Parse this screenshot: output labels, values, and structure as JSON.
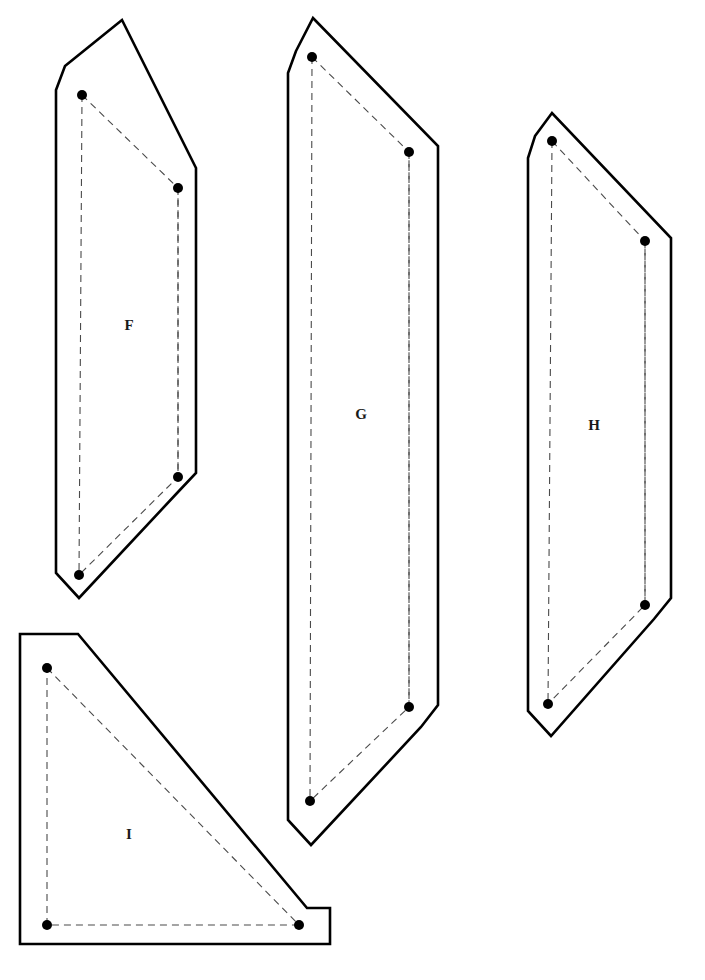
{
  "document": {
    "type": "technical-pattern-sheet",
    "title": "Pattern Pieces F G H I",
    "background_color": "#ffffff",
    "width": 705,
    "height": 980
  },
  "style": {
    "outline_color": "#000000",
    "outline_width": 2.6,
    "seam_color": "#4a4a4a",
    "seam_width": 1.1,
    "seam_dash": "7 5",
    "dot_color": "#000000",
    "dot_radius": 5.0,
    "label_color": "#1a1a1a",
    "label_size": 15
  },
  "pieces": [
    {
      "id": "piece-f",
      "label": "F",
      "label_position": {
        "x": 129,
        "y": 327
      },
      "outline_points": "65,66 122,20 196,168 196,473 178,492 79,598 56,573 56,90",
      "seam_points": "82,95 178,188 178,477 79,575",
      "dots": [
        {
          "name": "dot-f-top-left",
          "x": 82,
          "y": 95
        },
        {
          "name": "dot-f-top-right",
          "x": 178,
          "y": 188
        },
        {
          "name": "dot-f-bottom-right",
          "x": 178,
          "y": 477
        },
        {
          "name": "dot-f-bottom-left",
          "x": 79,
          "y": 575
        }
      ]
    },
    {
      "id": "piece-g",
      "label": "G",
      "label_position": {
        "x": 361,
        "y": 416
      },
      "outline_points": "296,51 313,18 438,146 438,705 421,727 311,845 288,820 288,73",
      "seam_points": "312,57 409,152 409,707 310,801",
      "dots": [
        {
          "name": "dot-g-top-left",
          "x": 312,
          "y": 57
        },
        {
          "name": "dot-g-top-right",
          "x": 409,
          "y": 152
        },
        {
          "name": "dot-g-bottom-right",
          "x": 409,
          "y": 707
        },
        {
          "name": "dot-g-bottom-left",
          "x": 310,
          "y": 801
        }
      ]
    },
    {
      "id": "piece-h",
      "label": "H",
      "label_position": {
        "x": 594,
        "y": 427
      },
      "outline_points": "535,136 552,113 671,238 671,598 654,619 551,736 528,711 528,158",
      "seam_points": "552,141 645,241 645,605 548,704",
      "dots": [
        {
          "name": "dot-h-top-left",
          "x": 552,
          "y": 141
        },
        {
          "name": "dot-h-top-right",
          "x": 645,
          "y": 241
        },
        {
          "name": "dot-h-bottom-right",
          "x": 645,
          "y": 605
        },
        {
          "name": "dot-h-bottom-left",
          "x": 548,
          "y": 704
        }
      ]
    },
    {
      "id": "piece-i",
      "label": "I",
      "label_position": {
        "x": 129,
        "y": 836
      },
      "outline_points": "20,634 56,634 78,634 307,908 330,908 330,944 20,944",
      "seam_points": "47,668 299,925 47,925 47,668",
      "dots": [
        {
          "name": "dot-i-top-left",
          "x": 47,
          "y": 668
        },
        {
          "name": "dot-i-bottom-right",
          "x": 299,
          "y": 925
        },
        {
          "name": "dot-i-bottom-left",
          "x": 47,
          "y": 925
        }
      ]
    }
  ]
}
